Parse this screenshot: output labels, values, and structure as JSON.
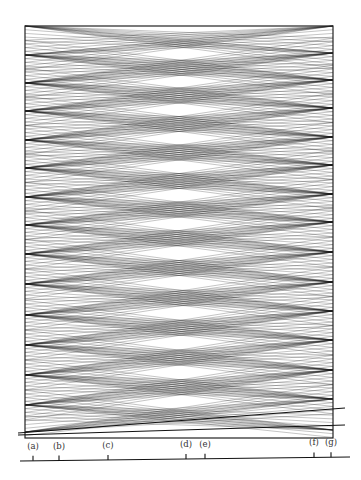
{
  "figure": {
    "width": 361,
    "height": 480,
    "box": {
      "left": 25,
      "right": 333,
      "top": 26,
      "bottom": 438
    },
    "line_color": "#111111",
    "ray_opacity": 0.55,
    "left_sources": [
      26,
      55,
      83,
      111,
      140,
      168,
      197,
      225,
      254,
      284,
      315,
      345,
      375,
      405,
      432
    ],
    "right_sources": [
      26,
      53,
      80,
      108,
      137,
      165,
      194,
      222,
      252,
      282,
      311,
      340,
      370,
      399,
      430
    ],
    "rays_per_source": 9,
    "ray_spread": 0.12,
    "slanted_lines": [
      {
        "x1": 18,
        "y1": 435,
        "x2": 345,
        "y2": 425
      },
      {
        "x1": 18,
        "y1": 433,
        "x2": 345,
        "y2": 408
      }
    ]
  },
  "axis": {
    "x1": 20,
    "y1": 461,
    "x2": 350,
    "y2": 457,
    "ticks": [
      {
        "label": "(a)",
        "x": 33
      },
      {
        "label": "(b)",
        "x": 59
      },
      {
        "label": "(c)",
        "x": 108
      },
      {
        "label": "(d)",
        "x": 186
      },
      {
        "label": "(e)",
        "x": 205
      },
      {
        "label": "(f)",
        "x": 314
      },
      {
        "label": "(g)",
        "x": 331
      }
    ]
  }
}
